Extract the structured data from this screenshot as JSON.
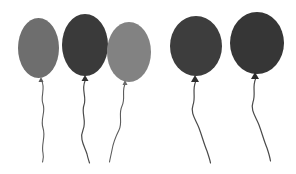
{
  "scene": {
    "title": "Five balloons",
    "width": 296,
    "height": 174,
    "background_color": "#ffffff",
    "group_labels": [
      "left-group-of-three",
      "right-group-of-two"
    ]
  },
  "balloons": [
    {
      "name": "balloon-1",
      "group": "left",
      "color": "#6e6e6e",
      "knot_color": "#5a5a5a",
      "string_color": "#5c5c5c",
      "cx": 38.5,
      "cy": 48,
      "rx": 20.5,
      "ry": 30,
      "knot_x": 41,
      "knot_y": 77,
      "knot_w": 5,
      "knot_h": 5,
      "string_path": "M41.5,80 C46,89 40,96 43,104 C46,112 40,119 43,128 C46,137 41,144 43,153 C44,158 43,160 42.5,162",
      "string_width": 1.1
    },
    {
      "name": "balloon-2",
      "group": "left",
      "color": "#3a3a3a",
      "knot_color": "#303030",
      "string_color": "#4a4a4a",
      "cx": 85,
      "cy": 45,
      "rx": 23,
      "ry": 31,
      "knot_x": 85,
      "knot_y": 75,
      "knot_w": 7,
      "knot_h": 6,
      "string_path": "M85,81 C81,90 87,97 84,105 C81,113 87,121 83,130 C79,139 85,147 87,154 C88,159 89,161 89.5,163",
      "string_width": 1.2
    },
    {
      "name": "balloon-3",
      "group": "left",
      "color": "#828282",
      "knot_color": "#6a6a6a",
      "string_color": "#5c5c5c",
      "cx": 129,
      "cy": 52,
      "rx": 22,
      "ry": 30,
      "knot_x": 125,
      "knot_y": 80,
      "knot_w": 5,
      "knot_h": 5,
      "string_path": "M125.5,83 C121,91 126,98 122,106 C118,114 123,122 119,130 C115,138 113,144 112,150 C111,155 110,159 109.5,162",
      "string_width": 1.1
    },
    {
      "name": "balloon-4",
      "group": "right",
      "color": "#3d3d3d",
      "knot_color": "#2e2e2e",
      "string_color": "#4a4a4a",
      "cx": 196,
      "cy": 46,
      "rx": 26,
      "ry": 30,
      "knot_x": 195,
      "knot_y": 75,
      "knot_w": 8,
      "knot_h": 7,
      "string_path": "M195.5,82 C192,90 196,97 193,105 C190,113 196,120 199,128 C202,136 204,144 207,151 C209,157 210,160 210.5,163",
      "string_width": 1.2
    },
    {
      "name": "balloon-5",
      "group": "right",
      "color": "#363636",
      "knot_color": "#2a2a2a",
      "string_color": "#4a4a4a",
      "cx": 257,
      "cy": 43,
      "rx": 27,
      "ry": 31,
      "knot_x": 255,
      "knot_y": 72,
      "knot_w": 8,
      "knot_h": 7,
      "string_path": "M255.5,79 C252,87 256,94 253,102 C250,110 256,117 259,125 C262,133 264,141 267,148 C269,154 270,158 270.5,161",
      "string_width": 1.2
    }
  ]
}
